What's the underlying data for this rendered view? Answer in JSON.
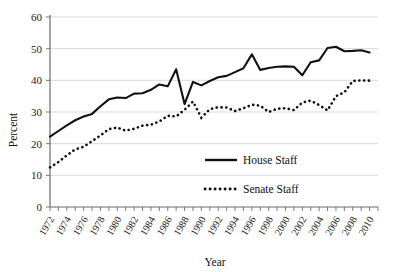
{
  "chart_data": {
    "type": "line",
    "title": "",
    "xlabel": "Year",
    "ylabel": "Percent",
    "ylim": [
      0,
      60
    ],
    "ytick_values": [
      0,
      10,
      20,
      30,
      40,
      50,
      60
    ],
    "ytick_labels": [
      "0",
      "10",
      "20",
      "30",
      "40",
      "50",
      "60"
    ],
    "xlim": [
      1972,
      2011
    ],
    "xtick_labels": [
      "1972",
      "1974",
      "1976",
      "1978",
      "1980",
      "1982",
      "1984",
      "1986",
      "1988",
      "1990",
      "1992",
      "1994",
      "1996",
      "1998",
      "2000",
      "2002",
      "2004",
      "2006",
      "2008",
      "2010"
    ],
    "xtick_step_minor": 1,
    "grid": "horizontal",
    "legend_position": "center-right-inside",
    "x": [
      1972,
      1973,
      1974,
      1975,
      1976,
      1977,
      1978,
      1979,
      1980,
      1981,
      1982,
      1983,
      1984,
      1985,
      1986,
      1987,
      1988,
      1989,
      1990,
      1991,
      1992,
      1993,
      1994,
      1995,
      1996,
      1997,
      1998,
      1999,
      2000,
      2001,
      2002,
      2003,
      2004,
      2005,
      2006,
      2007,
      2008,
      2009,
      2010
    ],
    "series": [
      {
        "name": "House Staff",
        "style": "solid",
        "color": "#111111",
        "values": [
          22.2,
          24.0,
          25.8,
          27.4,
          28.6,
          29.4,
          31.8,
          34.0,
          34.6,
          34.4,
          35.8,
          35.9,
          37.0,
          38.7,
          38.1,
          43.5,
          32.5,
          39.5,
          38.4,
          39.8,
          41.0,
          41.4,
          42.6,
          43.8,
          48.2,
          43.3,
          43.9,
          44.3,
          44.4,
          44.3,
          41.6,
          45.7,
          46.3,
          50.2,
          50.6,
          49.2,
          49.3,
          49.5,
          48.8
        ]
      },
      {
        "name": "Senate Staff",
        "style": "dotted",
        "color": "#111111",
        "values": [
          12.5,
          14.2,
          16.3,
          18.2,
          19.0,
          20.8,
          22.6,
          24.6,
          25.1,
          24.1,
          24.7,
          25.7,
          26.0,
          27.0,
          28.8,
          28.6,
          30.7,
          33.3,
          28.2,
          30.9,
          31.5,
          31.4,
          30.3,
          31.2,
          32.3,
          32.0,
          30.0,
          31.0,
          31.2,
          30.6,
          33.0,
          33.6,
          32.2,
          30.5,
          35.0,
          36.2,
          39.8,
          40.0,
          39.9
        ]
      }
    ]
  },
  "legend": {
    "entries": [
      {
        "label": "House Staff",
        "style": "solid"
      },
      {
        "label": "Senate Staff",
        "style": "dotted"
      }
    ]
  },
  "axes": {
    "y_title": "Percent",
    "x_title": "Year"
  }
}
